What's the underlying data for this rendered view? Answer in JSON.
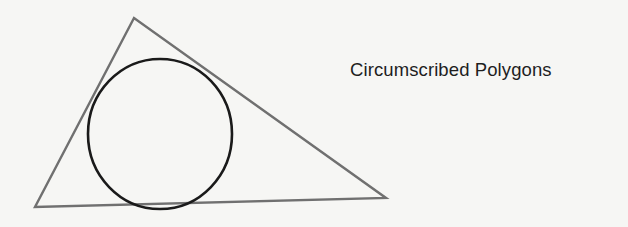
{
  "caption": "Circumscribed Polygons",
  "figure": {
    "triangle": {
      "points": [
        [
          134,
          18
        ],
        [
          35,
          207
        ],
        [
          386,
          198
        ]
      ],
      "stroke": "#707070"
    },
    "circle": {
      "cx": 160,
      "cy": 134,
      "rx": 72,
      "ry": 75,
      "stroke": "#1a1a1a"
    }
  }
}
